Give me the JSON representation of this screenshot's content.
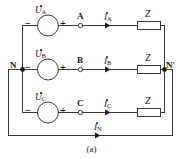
{
  "figure": {
    "caption": "(a)",
    "line_color": "#3a3a3a",
    "text_color": "#1a1a1a",
    "background": "#ffffff"
  },
  "sources": [
    {
      "id": "source-a",
      "label": "U",
      "sub": "A",
      "phasor_dot": true,
      "minus": "−",
      "plus": "+"
    },
    {
      "id": "source-b",
      "label": "U",
      "sub": "B",
      "phasor_dot": true,
      "minus": "−",
      "plus": "+"
    },
    {
      "id": "source-c",
      "label": "U",
      "sub": "C",
      "phasor_dot": true,
      "minus": "−",
      "plus": "+"
    }
  ],
  "terminals": [
    {
      "id": "terminal-a",
      "label": "A"
    },
    {
      "id": "terminal-b",
      "label": "B"
    },
    {
      "id": "terminal-c",
      "label": "C"
    }
  ],
  "nodes": [
    {
      "id": "node-n",
      "label": "N"
    },
    {
      "id": "node-n-prime",
      "label": "N′"
    }
  ],
  "currents": [
    {
      "id": "current-a",
      "label": "I",
      "sub": "A",
      "phasor_dot": true
    },
    {
      "id": "current-b",
      "label": "I",
      "sub": "B",
      "phasor_dot": true
    },
    {
      "id": "current-c",
      "label": "I",
      "sub": "C",
      "phasor_dot": true
    },
    {
      "id": "current-n",
      "label": "I",
      "sub": "N",
      "phasor_dot": true
    }
  ],
  "impedances": [
    {
      "id": "impedance-a",
      "label": "Z"
    },
    {
      "id": "impedance-b",
      "label": "Z"
    },
    {
      "id": "impedance-c",
      "label": "Z"
    }
  ]
}
